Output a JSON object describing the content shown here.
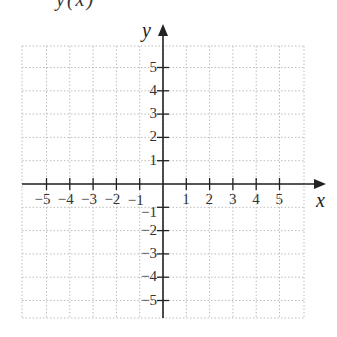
{
  "title_fragment": "y(x)",
  "axes": {
    "x_label": "x",
    "y_label": "y",
    "x_ticks": [
      "−5",
      "−4",
      "−3",
      "−2",
      "−1",
      "1",
      "2",
      "3",
      "4",
      "5"
    ],
    "y_ticks": [
      "5",
      "4",
      "3",
      "2",
      "1",
      "−1",
      "−2",
      "−3",
      "−4",
      "−5"
    ],
    "x_tick_values": [
      -5,
      -4,
      -3,
      -2,
      -1,
      1,
      2,
      3,
      4,
      5
    ],
    "y_tick_values": [
      5,
      4,
      3,
      2,
      1,
      -1,
      -2,
      -3,
      -4,
      -5
    ]
  },
  "grid": {
    "x_range": [
      -6,
      6
    ],
    "y_range": [
      -6,
      6
    ],
    "cell": 1,
    "line_style": "dotted",
    "line_color": "#bdbdbd",
    "axis_color": "#222222"
  }
}
